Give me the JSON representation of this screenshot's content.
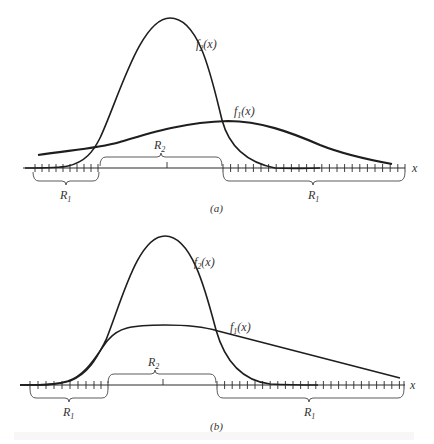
{
  "figure": {
    "panels": [
      {
        "id": "a",
        "caption": "(a)",
        "axis_label": "x",
        "curve_labels": {
          "f1": "f",
          "f1_sub": "1",
          "f2": "f",
          "f2_sub": "2",
          "arg": "(x)"
        },
        "regions": [
          {
            "name": "R",
            "sub": "1",
            "side": "left"
          },
          {
            "name": "R",
            "sub": "2",
            "side": "middle"
          },
          {
            "name": "R",
            "sub": "1",
            "side": "right"
          }
        ]
      },
      {
        "id": "b",
        "caption": "(b)",
        "axis_label": "x",
        "curve_labels": {
          "f1": "f",
          "f1_sub": "1",
          "f2": "f",
          "f2_sub": "2",
          "arg": "(x)"
        },
        "regions": [
          {
            "name": "R",
            "sub": "1",
            "side": "left"
          },
          {
            "name": "R",
            "sub": "2",
            "side": "middle"
          },
          {
            "name": "R",
            "sub": "1",
            "side": "right"
          }
        ]
      }
    ]
  }
}
